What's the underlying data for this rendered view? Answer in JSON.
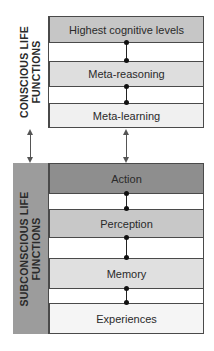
{
  "diagram": {
    "conscious": {
      "label_line1": "CONSCIOUS LIFE",
      "label_line2": "FUNCTIONS",
      "label_bg": "#ffffff",
      "boxes": [
        {
          "label": "Highest cognitive levels",
          "color": "#c6c6c6"
        },
        {
          "label": "Meta-reasoning",
          "color": "#dedede"
        },
        {
          "label": "Meta-learning",
          "color": "#f0f0f0"
        }
      ]
    },
    "subconscious": {
      "label_line1": "SUBCONSCIOUS LIFE",
      "label_line2": "FUNCTIONS",
      "label_bg": "#9c9c9c",
      "boxes": [
        {
          "label": "Action",
          "color": "#8e8e8e"
        },
        {
          "label": "Perception",
          "color": "#c8c8c8"
        },
        {
          "label": "Memory",
          "color": "#e0e0e0"
        },
        {
          "label": "Experiences",
          "color": "#f5f5f5"
        }
      ]
    },
    "connections": [
      {
        "from": "Highest cognitive levels",
        "to": "Meta-reasoning",
        "type": "dot-line"
      },
      {
        "from": "Meta-reasoning",
        "to": "Meta-learning",
        "type": "dot-line"
      },
      {
        "from": "Action",
        "to": "Perception",
        "type": "dot-line"
      },
      {
        "from": "Perception",
        "to": "Memory",
        "type": "dot-line"
      },
      {
        "from": "Memory",
        "to": "Experiences",
        "type": "dot-line"
      },
      {
        "from": "CONSCIOUS LIFE FUNCTIONS",
        "to": "SUBCONSCIOUS LIFE FUNCTIONS",
        "type": "bidirectional-arrow"
      },
      {
        "from": "Meta-learning",
        "to": "Action",
        "type": "bidirectional-arrow"
      }
    ]
  }
}
